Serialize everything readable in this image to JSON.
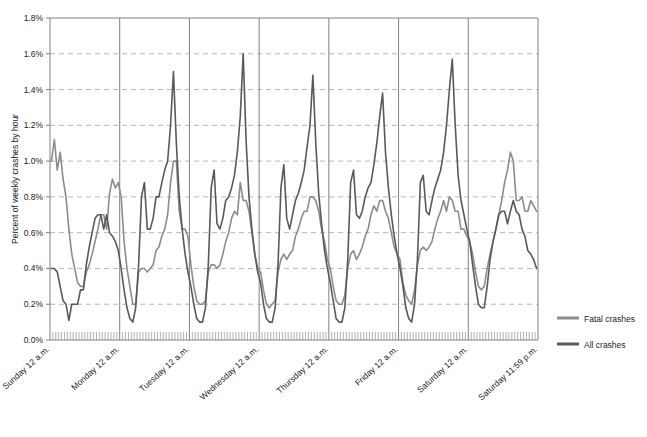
{
  "chart_data": {
    "type": "line",
    "title": "",
    "xlabel": "",
    "ylabel": "Percent of weekly crashes by hour",
    "ylim": [
      0,
      1.8
    ],
    "ytick_labels": [
      "0.0%",
      "0.2%",
      "0.4%",
      "0.6%",
      "0.8%",
      "1.0%",
      "1.2%",
      "1.4%",
      "1.6%",
      "1.8%"
    ],
    "ytick_values": [
      0.0,
      0.2,
      0.4,
      0.6,
      0.8,
      1.0,
      1.2,
      1.4,
      1.6,
      1.8
    ],
    "xtick_labels": [
      "Sunday 12 a.m.",
      "Monday 12 a.m.",
      "Tuesday 12 a.m.",
      "Wednesday 12 a.m.",
      "Thursday 12 a.m.",
      "Friday 12 a.m.",
      "Saturday 12 a.m.",
      "Saturday 11:59 p.m."
    ],
    "xtick_positions": [
      0,
      24,
      48,
      72,
      96,
      120,
      144,
      168
    ],
    "x_unit": "hour of week",
    "x_count": 168,
    "grid": "horizontal-dashed",
    "day_separators": true,
    "legend_position": "right",
    "legend": [
      "Fatal crashes",
      "All crashes"
    ],
    "colors": {
      "fatal": "#8c8c8c",
      "all": "#595959",
      "grid": "#b8b8b8",
      "axis": "#808080"
    },
    "series": [
      {
        "name": "Fatal crashes",
        "color": "#8c8c8c",
        "values": [
          1.0,
          1.12,
          0.95,
          1.05,
          0.9,
          0.8,
          0.62,
          0.48,
          0.4,
          0.32,
          0.3,
          0.3,
          0.38,
          0.42,
          0.48,
          0.55,
          0.62,
          0.7,
          0.7,
          0.62,
          0.82,
          0.9,
          0.85,
          0.88,
          0.8,
          0.55,
          0.4,
          0.3,
          0.2,
          0.2,
          0.38,
          0.4,
          0.4,
          0.38,
          0.4,
          0.42,
          0.5,
          0.52,
          0.58,
          0.62,
          0.7,
          0.88,
          1.0,
          1.0,
          0.72,
          0.62,
          0.62,
          0.58,
          0.42,
          0.3,
          0.22,
          0.2,
          0.2,
          0.22,
          0.38,
          0.42,
          0.42,
          0.4,
          0.42,
          0.48,
          0.55,
          0.6,
          0.68,
          0.72,
          0.7,
          0.88,
          0.78,
          0.78,
          0.72,
          0.6,
          0.48,
          0.4,
          0.38,
          0.28,
          0.2,
          0.18,
          0.2,
          0.22,
          0.38,
          0.45,
          0.48,
          0.45,
          0.48,
          0.5,
          0.58,
          0.62,
          0.68,
          0.72,
          0.72,
          0.8,
          0.8,
          0.78,
          0.72,
          0.62,
          0.55,
          0.45,
          0.4,
          0.3,
          0.22,
          0.2,
          0.2,
          0.25,
          0.4,
          0.48,
          0.5,
          0.45,
          0.48,
          0.52,
          0.58,
          0.62,
          0.7,
          0.75,
          0.72,
          0.78,
          0.78,
          0.72,
          0.68,
          0.6,
          0.52,
          0.48,
          0.45,
          0.32,
          0.25,
          0.22,
          0.2,
          0.28,
          0.42,
          0.5,
          0.52,
          0.5,
          0.52,
          0.55,
          0.62,
          0.68,
          0.72,
          0.78,
          0.72,
          0.8,
          0.78,
          0.72,
          0.72,
          0.62,
          0.62,
          0.58,
          0.55,
          0.48,
          0.38,
          0.3,
          0.28,
          0.3,
          0.4,
          0.48,
          0.55,
          0.62,
          0.7,
          0.78,
          0.88,
          0.95,
          1.05,
          1.0,
          0.78,
          0.78,
          0.8,
          0.72,
          0.72,
          0.78,
          0.75,
          0.72
        ]
      },
      {
        "name": "All crashes",
        "color": "#595959",
        "values": [
          0.4,
          0.4,
          0.38,
          0.3,
          0.22,
          0.2,
          0.11,
          0.2,
          0.2,
          0.2,
          0.28,
          0.28,
          0.42,
          0.52,
          0.6,
          0.68,
          0.7,
          0.7,
          0.62,
          0.7,
          0.6,
          0.58,
          0.55,
          0.5,
          0.4,
          0.28,
          0.18,
          0.12,
          0.1,
          0.18,
          0.42,
          0.8,
          0.88,
          0.62,
          0.62,
          0.68,
          0.8,
          0.8,
          0.88,
          0.95,
          1.0,
          1.2,
          1.5,
          1.1,
          0.8,
          0.62,
          0.48,
          0.38,
          0.3,
          0.2,
          0.12,
          0.1,
          0.1,
          0.18,
          0.42,
          0.85,
          0.95,
          0.65,
          0.62,
          0.68,
          0.78,
          0.8,
          0.85,
          0.92,
          1.05,
          1.25,
          1.6,
          1.12,
          0.8,
          0.62,
          0.48,
          0.38,
          0.32,
          0.2,
          0.12,
          0.1,
          0.1,
          0.18,
          0.42,
          0.85,
          0.98,
          0.68,
          0.62,
          0.7,
          0.78,
          0.82,
          0.88,
          0.95,
          1.08,
          1.2,
          1.48,
          1.1,
          0.82,
          0.65,
          0.5,
          0.4,
          0.32,
          0.22,
          0.12,
          0.1,
          0.1,
          0.18,
          0.45,
          0.88,
          0.95,
          0.7,
          0.68,
          0.72,
          0.8,
          0.85,
          0.88,
          0.98,
          1.1,
          1.25,
          1.38,
          1.05,
          0.85,
          0.7,
          0.58,
          0.48,
          0.4,
          0.3,
          0.18,
          0.12,
          0.1,
          0.2,
          0.45,
          0.88,
          0.92,
          0.72,
          0.7,
          0.78,
          0.85,
          0.9,
          0.95,
          1.05,
          1.2,
          1.4,
          1.57,
          1.2,
          0.92,
          0.78,
          0.7,
          0.62,
          0.55,
          0.42,
          0.3,
          0.2,
          0.18,
          0.18,
          0.3,
          0.45,
          0.55,
          0.62,
          0.7,
          0.72,
          0.72,
          0.65,
          0.72,
          0.78,
          0.72,
          0.7,
          0.62,
          0.58,
          0.5,
          0.48,
          0.45,
          0.4
        ]
      }
    ]
  },
  "legend": {
    "items": [
      {
        "label": "Fatal crashes",
        "color": "#8c8c8c"
      },
      {
        "label": "All crashes",
        "color": "#595959"
      }
    ]
  },
  "axis": {
    "y_title": "Percent of weekly crashes by hour"
  }
}
